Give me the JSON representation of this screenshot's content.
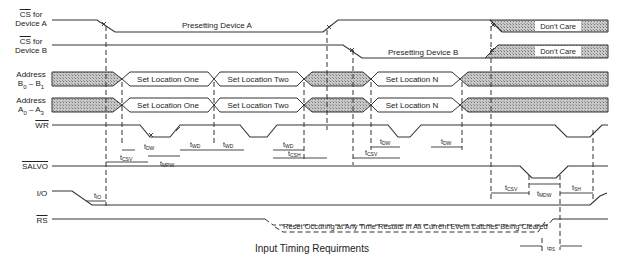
{
  "title": "Input Timing Requirments",
  "signals": [
    {
      "id": "cs_a",
      "label_line1": "CS",
      "label_line1_suffix": " for",
      "label_line2": "Device A",
      "overline": "CS"
    },
    {
      "id": "cs_b",
      "label_line1": "CS",
      "label_line1_suffix": " for",
      "label_line2": "Device B",
      "overline": "CS"
    },
    {
      "id": "addr_b",
      "label_line1": "Address",
      "label_line2": "B0 – B1"
    },
    {
      "id": "addr_a",
      "label_line1": "Address",
      "label_line2": "A0 – A3"
    },
    {
      "id": "wr",
      "label": "WR",
      "overline": true
    },
    {
      "id": "salvo",
      "label": "SALVO",
      "overline": true
    },
    {
      "id": "io",
      "label": "I/O"
    },
    {
      "id": "rs",
      "label": "RS",
      "overline": true
    }
  ],
  "annotations": {
    "cs_a_state": "Presetting Device A",
    "cs_b_state": "Presetting Device B",
    "dont_care_a": "Don't Care",
    "dont_care_b": "Don't Care",
    "addr_b_1": "Set Location One",
    "addr_b_2": "Set Location Two",
    "addr_b_n": "Set Location N",
    "addr_a_1": "Set Location One",
    "addr_a_2": "Set Location Two",
    "addr_a_n": "Set Location N",
    "reset_note": "Reset Occuring at Any Time Results In All Current Event Latches Being Cleared"
  },
  "timing_params": {
    "t_csv": "CSV",
    "t_dw": "DW",
    "t_mpw": "MPW",
    "t_wd": "WD",
    "t_csh": "CSH",
    "t_io": "IO",
    "t_mdw": "MDW",
    "t_sh": "SH",
    "t_rs": "RS"
  }
}
